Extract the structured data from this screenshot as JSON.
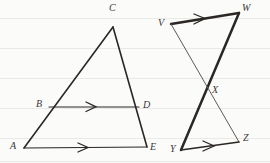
{
  "page": {
    "background_color": "#fbfbfa",
    "ink_color": "#2a2724",
    "rule_color": "#e9e9e6",
    "width": 270,
    "height": 163
  },
  "figures": [
    {
      "id": "triangle-ace",
      "name": "triangle-with-midsegment",
      "labels": [
        {
          "id": "A",
          "text": "A",
          "x": 10,
          "y": 141
        },
        {
          "id": "B",
          "text": "B",
          "x": 36,
          "y": 99
        },
        {
          "id": "C",
          "text": "C",
          "x": 109,
          "y": 3
        },
        {
          "id": "D",
          "text": "D",
          "x": 143,
          "y": 100
        },
        {
          "id": "E",
          "text": "E",
          "x": 150,
          "y": 142
        }
      ],
      "points": {
        "A": [
          24,
          148
        ],
        "B": [
          49,
          107
        ],
        "C": [
          113,
          27
        ],
        "D": [
          139,
          107
        ],
        "E": [
          147,
          147
        ]
      },
      "segments": [
        {
          "from": "A",
          "to": "C",
          "weight": "med",
          "arrow_marks": 0
        },
        {
          "from": "C",
          "to": "E",
          "weight": "med",
          "arrow_marks": 0
        },
        {
          "from": "A",
          "to": "E",
          "weight": "thin",
          "arrow_marks": 1
        },
        {
          "from": "B",
          "to": "D",
          "weight": "thin",
          "arrow_marks": 1
        }
      ]
    },
    {
      "id": "bowtie-vwxyz",
      "name": "crossed-segments-figure",
      "labels": [
        {
          "id": "V",
          "text": "V",
          "x": 158,
          "y": 18
        },
        {
          "id": "W",
          "text": "W",
          "x": 242,
          "y": 3
        },
        {
          "id": "X",
          "text": "X",
          "x": 212,
          "y": 85
        },
        {
          "id": "Y",
          "text": "Y",
          "x": 170,
          "y": 144
        },
        {
          "id": "Z",
          "text": "Z",
          "x": 243,
          "y": 133
        }
      ],
      "points": {
        "V": [
          171,
          24
        ],
        "W": [
          239,
          13
        ],
        "X": [
          205,
          95
        ],
        "Y": [
          181,
          150
        ],
        "Z": [
          239,
          142
        ]
      },
      "segments": [
        {
          "from": "V",
          "to": "W",
          "weight": "thick",
          "arrow_marks": 1
        },
        {
          "from": "W",
          "to": "Y",
          "weight": "thick",
          "arrow_marks": 0
        },
        {
          "from": "V",
          "to": "Z",
          "weight": "faint",
          "arrow_marks": 0
        },
        {
          "from": "Y",
          "to": "Z",
          "weight": "med",
          "arrow_marks": 1
        }
      ]
    }
  ],
  "ruled_lines_y": [
    18,
    48,
    78,
    108,
    138,
    161
  ]
}
